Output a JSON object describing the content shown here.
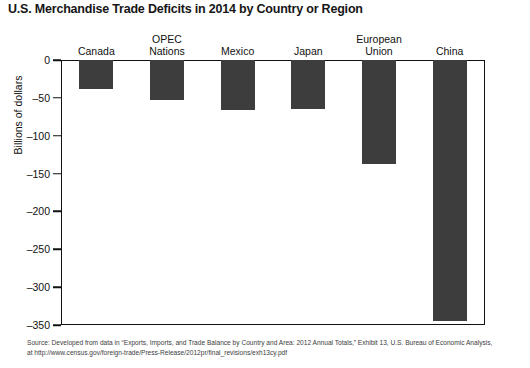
{
  "chart_data": {
    "type": "bar",
    "title": "U.S. Merchandise Trade Deficits in 2014 by Country or Region",
    "xlabel": "",
    "ylabel": "Billions of dollars",
    "categories": [
      "Canada",
      "OPEC Nations",
      "Mexico",
      "Japan",
      "European Union",
      "China"
    ],
    "category_lines": [
      [
        "Canada"
      ],
      [
        "OPEC",
        "Nations"
      ],
      [
        "Mexico"
      ],
      [
        "Japan"
      ],
      [
        "European",
        "Union"
      ],
      [
        "China"
      ]
    ],
    "values": [
      -38,
      -53,
      -66,
      -65,
      -137,
      -345
    ],
    "ylim": [
      -350,
      0
    ],
    "yticks": [
      0,
      -50,
      -100,
      -150,
      -200,
      -250,
      -300,
      -350
    ],
    "ytick_labels": [
      "0",
      "–50",
      "–100",
      "–150",
      "–200",
      "–250",
      "–300",
      "–350"
    ],
    "grid": false,
    "legend": "none",
    "bar_color": "#3d3d3d",
    "axis_color": "#111111"
  },
  "source": {
    "line1": "Source: Developed from data in “Exports, Imports, and Trade Balance by Country and Area: 2012 Annual Totals,” Exhibit 13, U.S. Bureau of Economic Analysis,",
    "line2": "at http://www.census.gov/foreign-trade/Press-Release/2012pr/final_revisions/exh13cy.pdf"
  }
}
